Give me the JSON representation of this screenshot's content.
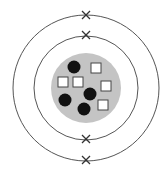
{
  "diagram": {
    "type": "atom-bohr-model",
    "center": [
      86,
      88
    ],
    "colors": {
      "background": "#ffffff",
      "orbit": "#555555",
      "nucleus": "#c4c4c4",
      "proton_or_neutron_filled": "#111111",
      "square_fill": "#ffffff",
      "square_stroke": "#444444",
      "electron": "#333333"
    },
    "shells": [
      {
        "name": "inner-shell",
        "radius": 52,
        "electrons": 2
      },
      {
        "name": "outer-shell",
        "radius": 73,
        "electrons": 2
      }
    ],
    "nucleus": {
      "radius": 35,
      "filled_circles": [
        {
          "cx": 74,
          "cy": 67
        },
        {
          "cx": 90,
          "cy": 94
        },
        {
          "cx": 65,
          "cy": 100
        },
        {
          "cx": 84,
          "cy": 109
        }
      ],
      "squares": [
        {
          "cx": 96,
          "cy": 68
        },
        {
          "cx": 63,
          "cy": 82
        },
        {
          "cx": 78,
          "cy": 82
        },
        {
          "cx": 106,
          "cy": 86
        },
        {
          "cx": 103,
          "cy": 105
        }
      ],
      "filled_count": 4,
      "square_count": 5
    },
    "electrons": [
      {
        "shell": "outer-shell",
        "cx": 86,
        "cy": 15
      },
      {
        "shell": "inner-shell",
        "cx": 86,
        "cy": 35
      },
      {
        "shell": "inner-shell",
        "cx": 86,
        "cy": 139
      },
      {
        "shell": "outer-shell",
        "cx": 86,
        "cy": 160
      }
    ]
  }
}
